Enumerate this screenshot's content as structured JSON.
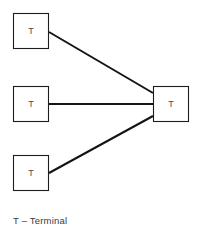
{
  "diagram": {
    "type": "network-topology",
    "title": "",
    "background_color": "#ffffff",
    "node_stroke_color": "#1d1d1d",
    "node_fill_color": "#ffffff",
    "link_color": "#141414",
    "label_color": "#4a4a4a",
    "nodes": [
      {
        "id": "terminal-top-left",
        "label": "T",
        "x": 13,
        "y": 13,
        "width": 36,
        "height": 36,
        "role": "terminal"
      },
      {
        "id": "terminal-middle-left",
        "label": "T",
        "x": 13,
        "y": 86,
        "width": 36,
        "height": 36,
        "role": "terminal"
      },
      {
        "id": "terminal-bottom-left",
        "label": "T",
        "x": 13,
        "y": 155,
        "width": 36,
        "height": 36,
        "role": "terminal"
      },
      {
        "id": "terminal-right-hub",
        "label": "T",
        "x": 153,
        "y": 86,
        "width": 36,
        "height": 36,
        "role": "terminal"
      }
    ],
    "links": [
      {
        "id": "link-top-to-hub",
        "from": "terminal-top-left",
        "to": "terminal-right-hub",
        "x1": 49,
        "y1": 32,
        "x2": 153,
        "y2": 93
      },
      {
        "id": "link-middle-to-hub",
        "from": "terminal-middle-left",
        "to": "terminal-right-hub",
        "x1": 49,
        "y1": 104,
        "x2": 153,
        "y2": 104
      },
      {
        "id": "link-bottom-to-hub",
        "from": "terminal-bottom-left",
        "to": "terminal-right-hub",
        "x1": 49,
        "y1": 173,
        "x2": 153,
        "y2": 116
      }
    ]
  },
  "legend": {
    "text": "T – Terminal",
    "symbol": "T",
    "meaning": "Terminal"
  }
}
